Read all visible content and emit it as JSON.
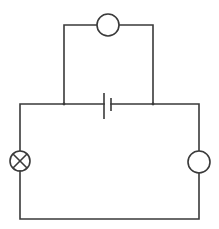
{
  "diagram": {
    "type": "circuit-schematic",
    "background": "#ffffff",
    "line_color": "#3a3a3a",
    "components": [
      {
        "id": "meter-top",
        "kind": "meter-circle",
        "label": "",
        "cx": 108,
        "cy": 25,
        "r": 11
      },
      {
        "id": "cell",
        "kind": "battery-cell",
        "label": "",
        "x_long": 104,
        "x_short": 111,
        "y": 104
      },
      {
        "id": "lamp",
        "kind": "lamp",
        "label": "",
        "cx": 20,
        "cy": 161,
        "r": 10
      },
      {
        "id": "meter-right",
        "kind": "meter-circle",
        "label": "",
        "cx": 199,
        "cy": 162,
        "r": 11
      }
    ],
    "junctions": [
      {
        "x": 64,
        "y": 104
      },
      {
        "x": 153,
        "y": 104
      }
    ]
  }
}
